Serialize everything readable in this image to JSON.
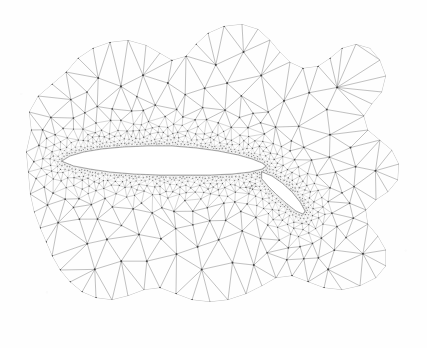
{
  "figure": {
    "kind": "unstructured-triangular-mesh",
    "background_color": "#fefefe",
    "ink_color": "#4a4a4a",
    "vertex_color": "#3a3a3a",
    "body_fill": "#ffffff"
  },
  "caption": {
    "clipped_text": "Figure",
    "note": "caption text is cropped at the top edge; only glyph descenders are visible"
  },
  "chart_data": {
    "type": "scatter",
    "title": "",
    "subtitle": "",
    "xlabel": "",
    "ylabel": "",
    "grid": false,
    "legend_position": "none",
    "xlim": [
      0,
      427
    ],
    "ylim": [
      348,
      0
    ],
    "annotations": [],
    "domain_outline": [
      [
        28,
        172
      ],
      [
        26,
        152
      ],
      [
        31,
        130
      ],
      [
        29,
        112
      ],
      [
        38,
        96
      ],
      [
        52,
        84
      ],
      [
        66,
        72
      ],
      [
        78,
        58
      ],
      [
        93,
        48
      ],
      [
        110,
        42
      ],
      [
        128,
        40
      ],
      [
        146,
        45
      ],
      [
        160,
        53
      ],
      [
        172,
        60
      ],
      [
        186,
        56
      ],
      [
        196,
        44
      ],
      [
        208,
        33
      ],
      [
        224,
        26
      ],
      [
        242,
        24
      ],
      [
        258,
        29
      ],
      [
        270,
        40
      ],
      [
        280,
        52
      ],
      [
        290,
        62
      ],
      [
        303,
        68
      ],
      [
        318,
        66
      ],
      [
        330,
        58
      ],
      [
        342,
        48
      ],
      [
        356,
        44
      ],
      [
        370,
        48
      ],
      [
        380,
        60
      ],
      [
        386,
        76
      ],
      [
        382,
        92
      ],
      [
        372,
        104
      ],
      [
        364,
        116
      ],
      [
        368,
        130
      ],
      [
        380,
        140
      ],
      [
        392,
        150
      ],
      [
        399,
        164
      ],
      [
        398,
        180
      ],
      [
        388,
        192
      ],
      [
        376,
        200
      ],
      [
        366,
        210
      ],
      [
        368,
        224
      ],
      [
        378,
        236
      ],
      [
        386,
        250
      ],
      [
        386,
        266
      ],
      [
        376,
        278
      ],
      [
        360,
        286
      ],
      [
        342,
        290
      ],
      [
        324,
        288
      ],
      [
        308,
        282
      ],
      [
        292,
        276
      ],
      [
        276,
        278
      ],
      [
        262,
        286
      ],
      [
        246,
        294
      ],
      [
        228,
        300
      ],
      [
        210,
        302
      ],
      [
        192,
        300
      ],
      [
        176,
        294
      ],
      [
        160,
        288
      ],
      [
        144,
        290
      ],
      [
        128,
        296
      ],
      [
        112,
        300
      ],
      [
        96,
        298
      ],
      [
        82,
        292
      ],
      [
        70,
        282
      ],
      [
        60,
        270
      ],
      [
        52,
        256
      ],
      [
        46,
        242
      ],
      [
        40,
        228
      ],
      [
        34,
        212
      ],
      [
        30,
        194
      ]
    ],
    "airfoil_main_outline": [
      [
        62,
        161
      ],
      [
        70,
        156
      ],
      [
        84,
        152
      ],
      [
        102,
        149
      ],
      [
        124,
        147
      ],
      [
        148,
        146
      ],
      [
        172,
        146
      ],
      [
        196,
        148
      ],
      [
        218,
        151
      ],
      [
        238,
        155
      ],
      [
        252,
        159
      ],
      [
        262,
        163
      ],
      [
        266,
        166
      ],
      [
        262,
        169
      ],
      [
        250,
        172
      ],
      [
        232,
        174
      ],
      [
        210,
        175
      ],
      [
        186,
        175
      ],
      [
        160,
        175
      ],
      [
        134,
        174
      ],
      [
        110,
        172
      ],
      [
        90,
        169
      ],
      [
        74,
        166
      ]
    ],
    "airfoil_flap_outline": [
      [
        262,
        172
      ],
      [
        272,
        176
      ],
      [
        282,
        183
      ],
      [
        292,
        192
      ],
      [
        300,
        202
      ],
      [
        305,
        211
      ],
      [
        303,
        214
      ],
      [
        296,
        211
      ],
      [
        286,
        203
      ],
      [
        276,
        194
      ],
      [
        268,
        186
      ],
      [
        262,
        179
      ]
    ],
    "refinement": {
      "wall_cell_size_px": 1.6,
      "farfield_cell_size_px": 28,
      "growth": "geometric, density decays with distance from body surfaces",
      "wake_refinement": true
    },
    "counts": {
      "approx_vertices": 2600,
      "approx_triangles": 5000
    }
  }
}
